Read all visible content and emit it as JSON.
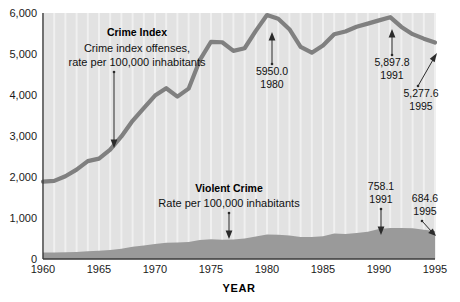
{
  "chart_data": {
    "type": "line",
    "title": "",
    "xlabel": "YEAR",
    "ylabel": "",
    "xlim": [
      1960,
      1995
    ],
    "ylim": [
      0,
      6000
    ],
    "grid": true,
    "legend_position": "inline-annotations",
    "x_ticks": [
      "1960",
      "1965",
      "1970",
      "1975",
      "1980",
      "1985",
      "1990",
      "1995"
    ],
    "x_tick_values": [
      1960,
      1965,
      1970,
      1975,
      1980,
      1985,
      1990,
      1995
    ],
    "y_ticks": [
      "0",
      "1,000",
      "2,000",
      "3,000",
      "4,000",
      "5,000",
      "6,000"
    ],
    "y_tick_values": [
      0,
      1000,
      2000,
      3000,
      4000,
      5000,
      6000
    ],
    "x": [
      1960,
      1961,
      1962,
      1963,
      1964,
      1965,
      1966,
      1967,
      1968,
      1969,
      1970,
      1971,
      1972,
      1973,
      1974,
      1975,
      1976,
      1977,
      1978,
      1979,
      1980,
      1981,
      1982,
      1983,
      1984,
      1985,
      1986,
      1987,
      1988,
      1989,
      1990,
      1991,
      1992,
      1993,
      1994,
      1995
    ],
    "series": [
      {
        "name": "Crime Index",
        "render": "line",
        "color": "#808080",
        "values": [
          1887,
          1906,
          2019,
          2180,
          2388,
          2449,
          2670,
          2989,
          3370,
          3680,
          3985,
          4165,
          3961,
          4155,
          4850,
          5298,
          5287,
          5077,
          5140,
          5565,
          5950,
          5858,
          5604,
          5175,
          5031,
          5207,
          5480,
          5550,
          5664,
          5741,
          5820,
          5898,
          5660,
          5484,
          5374,
          5278
        ]
      },
      {
        "name": "Violent Crime",
        "render": "area",
        "color": "#9a9a9a",
        "values": [
          161,
          158,
          162,
          168,
          191,
          200,
          220,
          253,
          298,
          329,
          364,
          396,
          401,
          417,
          461,
          482,
          468,
          476,
          498,
          549,
          597,
          594,
          571,
          538,
          539,
          557,
          620,
          610,
          637,
          663,
          732,
          758,
          758,
          747,
          714,
          685
        ]
      }
    ],
    "annotations": [
      {
        "id": "crime-index-callout",
        "title": "Crime Index",
        "line1": "Crime index offenses,",
        "line2": "rate per 100,000 inhabitants"
      },
      {
        "id": "violent-crime-callout",
        "title": "Violent Crime",
        "line1": "Rate per 100,000 inhabitants"
      },
      {
        "id": "peak-1980",
        "value": "5950.0",
        "year": "1980"
      },
      {
        "id": "peak-1991",
        "value": "5,897.8",
        "year": "1991"
      },
      {
        "id": "end-1995",
        "value": "5,277.6",
        "year": "1995"
      },
      {
        "id": "violent-1991",
        "value": "758.1",
        "year": "1991"
      },
      {
        "id": "violent-1995",
        "value": "684.6",
        "year": "1995"
      }
    ],
    "colors": {
      "plot_background": "#e2e2e2",
      "gridline": "#f0f0f0",
      "crime_index_line": "#808080",
      "violent_crime_fill": "#9c9c9c",
      "axis": "#3a3a3a",
      "text": "#111111",
      "page_background": "#ffffff"
    }
  }
}
